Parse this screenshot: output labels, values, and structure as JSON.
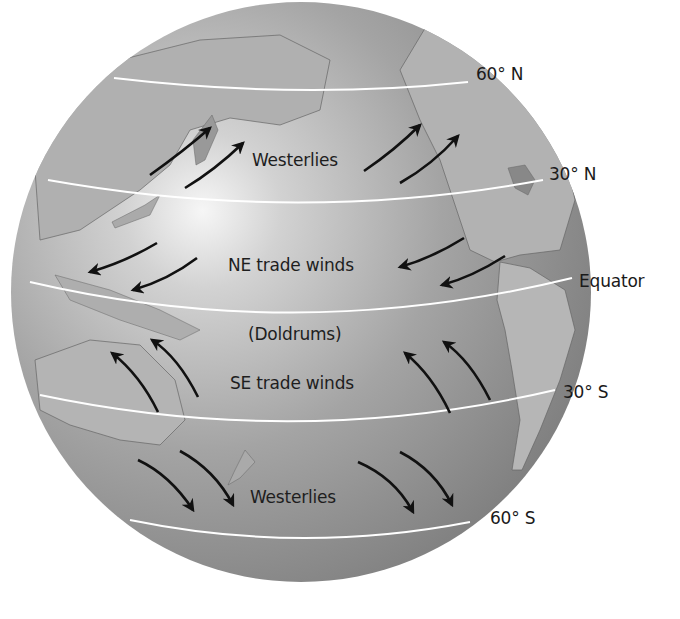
{
  "diagram": {
    "latitude_labels": {
      "n60": "60° N",
      "n30": "30° N",
      "equator": "Equator",
      "s30": "30° S",
      "s60": "60° S"
    },
    "wind_labels": {
      "north_westerlies": "Westerlies",
      "ne_trades": "NE trade winds",
      "doldrums": "(Doldrums)",
      "se_trades": "SE trade winds",
      "south_westerlies": "Westerlies"
    },
    "arrows": [
      {
        "belt": "Westerlies (N)",
        "direction": "southwest-to-northeast",
        "count": 4
      },
      {
        "belt": "NE trade winds",
        "direction": "northeast-to-southwest",
        "count": 4
      },
      {
        "belt": "SE trade winds",
        "direction": "southeast-to-northwest",
        "count": 4
      },
      {
        "belt": "Westerlies (S)",
        "direction": "northwest-to-southeast",
        "count": 4
      }
    ],
    "colors": {
      "ocean": "#8e8e8e",
      "land": "#b4b4b4",
      "highlight": "#f4f4f4",
      "lat_line": "#ffffff",
      "arrow": "#111111",
      "text": "#1a1a1a"
    }
  }
}
